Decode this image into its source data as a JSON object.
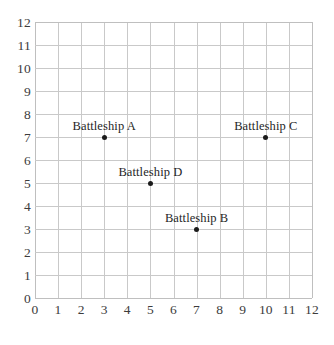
{
  "chart_data": {
    "type": "scatter",
    "title": "",
    "subtitle": "",
    "xlabel": "",
    "ylabel": "",
    "xlim": [
      0,
      12
    ],
    "ylim": [
      0,
      12
    ],
    "grid": true,
    "legend_position": "none",
    "x_ticks": [
      "0",
      "1",
      "2",
      "3",
      "4",
      "5",
      "6",
      "7",
      "8",
      "9",
      "10",
      "11",
      "12"
    ],
    "y_ticks": [
      "0",
      "1",
      "2",
      "3",
      "4",
      "5",
      "6",
      "7",
      "8",
      "9",
      "10",
      "11",
      "12"
    ],
    "point_color": "#1a1a1a",
    "grid_color": "#c9c9c9",
    "axis_text_color": "#3c3c3c",
    "background_color": "#ffffff",
    "points": [
      {
        "label": "Battleship A",
        "x": 3,
        "y": 7,
        "label_dx": 0,
        "label_dy": -11
      },
      {
        "label": "Battleship C",
        "x": 10,
        "y": 7,
        "label_dx": 0,
        "label_dy": -11
      },
      {
        "label": "Battleship D",
        "x": 5,
        "y": 5,
        "label_dx": 0,
        "label_dy": -11
      },
      {
        "label": "Battleship B",
        "x": 7,
        "y": 3,
        "label_dx": 0,
        "label_dy": -11
      }
    ]
  }
}
